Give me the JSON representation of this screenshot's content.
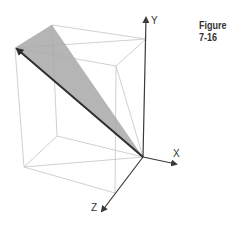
{
  "figure": {
    "caption": "Figure 7-16",
    "axes": {
      "x_label": "X",
      "y_label": "Y",
      "z_label": "Z"
    },
    "colors": {
      "plane_fill": "#a8a8a8",
      "box_edges": "#c4c4c4",
      "axes": "#3a3a3a",
      "vector": "#2e2e2e"
    }
  }
}
